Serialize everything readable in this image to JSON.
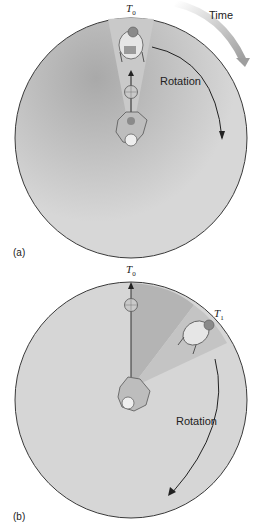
{
  "figure": {
    "panels": [
      {
        "id": "a",
        "label": "(a)",
        "time_label": "Time",
        "rotation_label": "Rotation",
        "marker_t0": "T",
        "marker_t0_sub": "0",
        "description": "Thrower at center tosses ball straight toward catcher at T0 on rotating disk"
      },
      {
        "id": "b",
        "label": "(b)",
        "rotation_label": "Rotation",
        "marker_t0": "T",
        "marker_t0_sub": "0",
        "marker_t1": "T",
        "marker_t1_sub": "1",
        "description": "Ball travels straight to T0 while catcher has rotated to T1"
      }
    ],
    "colors": {
      "disk_fill": "#d6d6d6",
      "disk_stroke": "#3a3a3a",
      "wedge_light": "#c4c4c4",
      "wedge_dark": "#a8a8a8",
      "time_arrow": "#bdbdbd",
      "text": "#222222"
    }
  }
}
